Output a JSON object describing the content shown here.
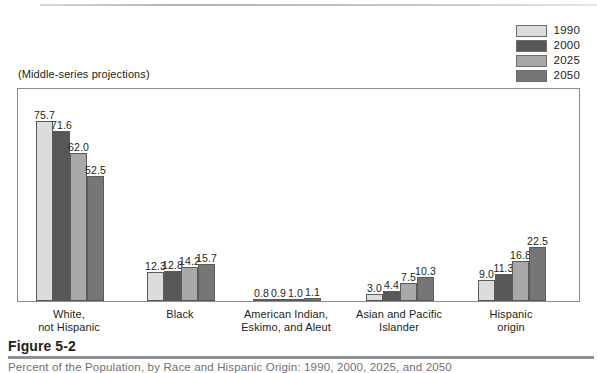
{
  "figure": {
    "number": "Figure 5-2",
    "caption": "Percent of the Population, by Race and Hispanic Origin: 1990, 2000, 2025, and 2050",
    "subtitle": "(Middle-series projections)"
  },
  "legend": {
    "items": [
      {
        "label": "1990",
        "color": "#dcdcdc"
      },
      {
        "label": "2000",
        "color": "#575757"
      },
      {
        "label": "2025",
        "color": "#a8a8a8"
      },
      {
        "label": "2050",
        "color": "#767676"
      }
    ]
  },
  "chart_data": {
    "type": "bar",
    "title": "Percent of the Population, by Race and Hispanic Origin: 1990, 2000, 2025, and 2050",
    "subtitle": "(Middle-series projections)",
    "xlabel": "",
    "ylabel": "",
    "ylim": [
      0,
      80
    ],
    "grid": false,
    "legend_position": "top-right",
    "categories": [
      "White,\nnot Hispanic",
      "Black",
      "American Indian,\nEskimo, and Aleut",
      "Asian and Pacific\nIslander",
      "Hispanic\norigin"
    ],
    "category_lines": [
      [
        "White,",
        "not Hispanic"
      ],
      [
        "Black"
      ],
      [
        "American Indian,",
        "Eskimo, and Aleut"
      ],
      [
        "Asian and Pacific",
        "Islander"
      ],
      [
        "Hispanic",
        "origin"
      ]
    ],
    "series": [
      {
        "name": "1990",
        "color": "#dcdcdc",
        "values": [
          75.7,
          12.3,
          0.8,
          3.0,
          9.0
        ]
      },
      {
        "name": "2000",
        "color": "#575757",
        "values": [
          71.6,
          12.8,
          0.9,
          4.4,
          11.3
        ]
      },
      {
        "name": "2025",
        "color": "#a8a8a8",
        "values": [
          62.0,
          14.2,
          1.0,
          7.5,
          16.8
        ]
      },
      {
        "name": "2050",
        "color": "#767676",
        "values": [
          52.5,
          15.7,
          1.1,
          10.3,
          22.5
        ]
      }
    ],
    "value_labels": [
      [
        "75.7",
        "71.6",
        "62.0",
        "52.5"
      ],
      [
        "12.3",
        "12.8",
        "14.2",
        "15.7"
      ],
      [
        "0.8",
        "0.9",
        "1.0",
        "1.1"
      ],
      [
        "3.0",
        "4.4",
        "7.5",
        "10.3"
      ],
      [
        "9.0",
        "11.3",
        "16.8",
        "22.5"
      ]
    ]
  },
  "layout": {
    "group_left_px": [
      36,
      147,
      253,
      366,
      478
    ],
    "plot_height_px": 213,
    "value_scale_px_per_unit": 2.38
  }
}
